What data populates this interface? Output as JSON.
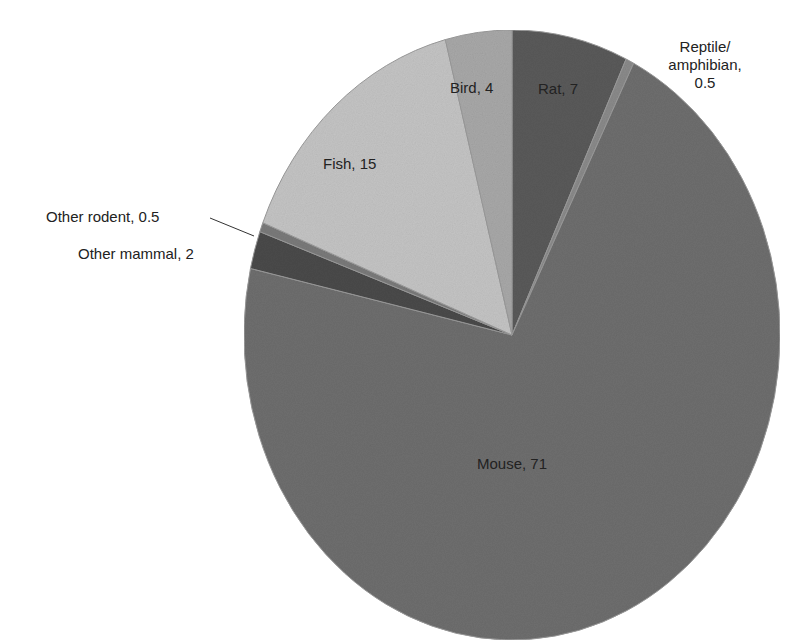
{
  "chart_data": {
    "type": "pie",
    "title": "",
    "start_angle_deg": 0,
    "direction": "clockwise",
    "slices": [
      {
        "label": "Rat",
        "value": 7,
        "color": "#5a5a5a",
        "display": "Rat, 7"
      },
      {
        "label": "Reptile/ amphibian",
        "value": 0.5,
        "color": "#8a8a8a",
        "display": "Reptile/ amphibian, 0.5"
      },
      {
        "label": "Mouse",
        "value": 71,
        "color": "#6e6e6e",
        "display": "Mouse, 71"
      },
      {
        "label": "Other mammal",
        "value": 2,
        "color": "#4a4a4a",
        "display": "Other mammal, 2"
      },
      {
        "label": "Other rodent",
        "value": 0.5,
        "color": "#7a7a7a",
        "display": "Other rodent, 0.5"
      },
      {
        "label": "Fish",
        "value": 15,
        "color": "#c4c4c4",
        "display": "Fish, 15"
      },
      {
        "label": "Bird",
        "value": 4,
        "color": "#a8a8a8",
        "display": "Bird, 4"
      }
    ],
    "legend": "none (labels on slices)"
  },
  "labels": {
    "rat": "Rat, 7",
    "reptile_line1": "Reptile/",
    "reptile_line2": "amphibian,",
    "reptile_line3": "0.5",
    "mouse": "Mouse, 71",
    "other_mammal": "Other mammal, 2",
    "other_rodent": "Other rodent, 0.5",
    "fish": "Fish, 15",
    "bird": "Bird, 4"
  }
}
